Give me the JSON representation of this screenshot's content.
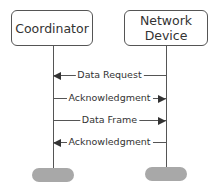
{
  "participants": [
    {
      "name": "Coordinator"
    },
    {
      "name": "Network Device",
      "lines": [
        "Network",
        "Device"
      ]
    }
  ],
  "messages": [
    {
      "label": "Data Request",
      "from": "Network Device",
      "to": "Coordinator",
      "direction": "left"
    },
    {
      "label": "Acknowledgment",
      "from": "Coordinator",
      "to": "Network Device",
      "direction": "right"
    },
    {
      "label": "Data Frame",
      "from": "Coordinator",
      "to": "Network Device",
      "direction": "right"
    },
    {
      "label": "Acknowledgment",
      "from": "Network Device",
      "to": "Coordinator",
      "direction": "left"
    }
  ],
  "colors": {
    "line": "#555555",
    "lifeline_end": "#a8a8a8",
    "background": "#ffffff"
  }
}
